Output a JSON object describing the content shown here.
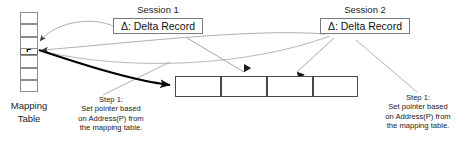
{
  "diagram": {
    "background": "#ffffff",
    "line_color_thin": "#9a9a9a",
    "line_color_thick": "#000000",
    "box_border": "#7a7a7a"
  },
  "mapping_table": {
    "label_line1": "Mapping",
    "label_line2": "Table",
    "cells": [
      {
        "value": ""
      },
      {
        "value": ""
      },
      {
        "value": "P"
      },
      {
        "value": ""
      },
      {
        "value": ""
      },
      {
        "value": ""
      },
      {
        "value": ""
      }
    ],
    "marked_index": 2
  },
  "sessions": [
    {
      "title": "Session 1",
      "delta_label": "Δ: Delta Record"
    },
    {
      "title": "Session 2",
      "delta_label": "Δ: Delta Record"
    }
  ],
  "page_chain": {
    "cells": [
      {
        "value": ""
      },
      {
        "value": ""
      },
      {
        "value": ""
      },
      {
        "value": ""
      }
    ]
  },
  "step_notes": [
    {
      "line1": "Step 1:",
      "line2": "Set pointer based",
      "line3": "on Address(P) from",
      "line4": "the mapping table."
    },
    {
      "line1": "Step 1:",
      "line2": "Set pointer based",
      "line3": "on Address(P) from",
      "line4": "the mapping table."
    }
  ]
}
